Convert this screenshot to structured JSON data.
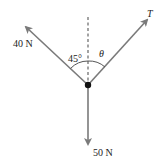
{
  "diagram": {
    "type": "free-body force diagram",
    "forces": [
      {
        "id": "left",
        "label": "40 N",
        "direction": "up-left",
        "angle_from_vertical": "45°"
      },
      {
        "id": "right",
        "label": "T",
        "direction": "up-right",
        "angle_from_vertical": "θ"
      },
      {
        "id": "down",
        "label": "50 N",
        "direction": "down"
      }
    ],
    "angle_labels": {
      "left": "45°",
      "right": "θ"
    },
    "colors": {
      "arrow": "#7a7a7a",
      "dot": "#111111",
      "text": "#222222"
    }
  }
}
